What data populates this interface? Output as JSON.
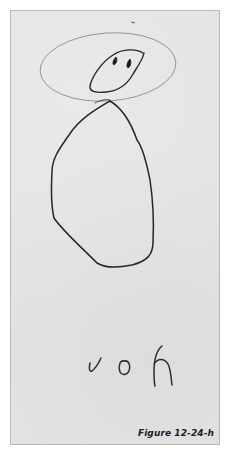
{
  "figure": {
    "caption": "Figure 12-24-h",
    "handwritten_text": "voh"
  },
  "colors": {
    "background": "#ffffff",
    "paper": "#e4e4e4",
    "paper_border": "#b9b9b9",
    "pencil_light": "#7a7a7a",
    "pencil_dark": "#232323",
    "caption_text": "#1e1e1e"
  }
}
